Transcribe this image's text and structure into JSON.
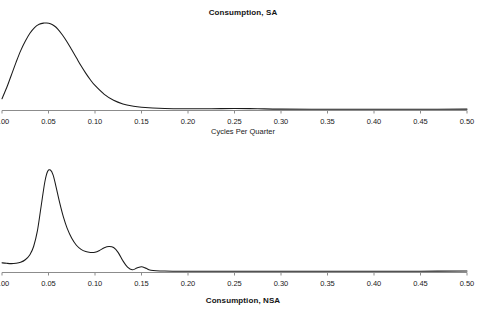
{
  "figure": {
    "background_color": "#ffffff",
    "line_color": "#1a1a1a",
    "axis_color": "#8c8c8c"
  },
  "panels": [
    {
      "id": "sa",
      "title": "Consumption, SA",
      "xlabel": "Cycles Per Quarter"
    },
    {
      "id": "nsa",
      "title": "Consumption, NSA",
      "xlabel": "Cycles Per Quarter"
    }
  ],
  "ticks": {
    "labels": [
      "0.00",
      "0.05",
      "0.10",
      "0.15",
      "0.20",
      "0.25",
      "0.30",
      "0.35",
      "0.40",
      "0.45",
      "0.50"
    ],
    "values": [
      0.0,
      0.05,
      0.1,
      0.15,
      0.2,
      0.25,
      0.3,
      0.35,
      0.4,
      0.45,
      0.5
    ]
  },
  "chart_data": [
    {
      "type": "line",
      "id": "consumption-sa",
      "title": "Consumption, SA",
      "xlabel": "Cycles Per Quarter",
      "ylabel": "",
      "xlim": [
        0.0,
        0.5
      ],
      "ylim": [
        0.0,
        1.0
      ],
      "xticks": [
        0.0,
        0.05,
        0.1,
        0.15,
        0.2,
        0.25,
        0.3,
        0.35,
        0.4,
        0.45,
        0.5
      ],
      "xticklabels": [
        "0.00",
        "0.05",
        "0.10",
        "0.15",
        "0.20",
        "0.25",
        "0.30",
        "0.35",
        "0.40",
        "0.45",
        "0.50"
      ],
      "grid": false,
      "legend": false,
      "notes": "Spectral density, seasonally adjusted. Single broad smooth peak near 0.048 cycles per quarter, long flat near-zero tail beyond 0.15.",
      "series": [
        {
          "name": "spectral density",
          "x": [
            0.0,
            0.005,
            0.01,
            0.015,
            0.02,
            0.025,
            0.03,
            0.035,
            0.04,
            0.045,
            0.048,
            0.052,
            0.056,
            0.06,
            0.065,
            0.07,
            0.075,
            0.08,
            0.085,
            0.09,
            0.095,
            0.1,
            0.11,
            0.12,
            0.13,
            0.14,
            0.15,
            0.175,
            0.2,
            0.225,
            0.25,
            0.275,
            0.3,
            0.35,
            0.4,
            0.45,
            0.5
          ],
          "y": [
            0.13,
            0.255,
            0.4,
            0.545,
            0.68,
            0.79,
            0.882,
            0.948,
            0.985,
            0.999,
            1.0,
            0.992,
            0.968,
            0.93,
            0.862,
            0.782,
            0.692,
            0.6,
            0.508,
            0.424,
            0.348,
            0.282,
            0.18,
            0.112,
            0.07,
            0.046,
            0.032,
            0.018,
            0.014,
            0.014,
            0.018,
            0.014,
            0.01,
            0.008,
            0.008,
            0.008,
            0.01
          ]
        }
      ]
    },
    {
      "type": "line",
      "id": "consumption-nsa",
      "title": "Consumption, NSA",
      "xlabel": "Cycles Per Quarter",
      "ylabel": "",
      "xlim": [
        0.0,
        0.5
      ],
      "ylim": [
        0.0,
        1.0
      ],
      "xticks": [
        0.0,
        0.05,
        0.1,
        0.15,
        0.2,
        0.25,
        0.3,
        0.35,
        0.4,
        0.45,
        0.5
      ],
      "xticklabels": [
        "0.00",
        "0.05",
        "0.10",
        "0.15",
        "0.20",
        "0.25",
        "0.30",
        "0.35",
        "0.40",
        "0.45",
        "0.50"
      ],
      "grid": false,
      "legend": false,
      "notes": "Spectral density, not seasonally adjusted. Sharp dominant spike near 0.052, secondary bump near 0.115, small bump near 0.147, flat tail beyond 0.16.",
      "series": [
        {
          "name": "spectral density",
          "x": [
            0.0,
            0.005,
            0.01,
            0.015,
            0.02,
            0.025,
            0.03,
            0.034,
            0.038,
            0.042,
            0.046,
            0.049,
            0.052,
            0.055,
            0.058,
            0.062,
            0.066,
            0.07,
            0.075,
            0.08,
            0.085,
            0.09,
            0.095,
            0.1,
            0.105,
            0.11,
            0.115,
            0.12,
            0.125,
            0.13,
            0.135,
            0.14,
            0.145,
            0.15,
            0.155,
            0.16,
            0.175,
            0.2,
            0.25,
            0.3,
            0.35,
            0.4,
            0.45,
            0.5
          ],
          "y": [
            0.09,
            0.085,
            0.082,
            0.085,
            0.095,
            0.12,
            0.17,
            0.25,
            0.4,
            0.64,
            0.88,
            0.985,
            1.0,
            0.95,
            0.84,
            0.68,
            0.54,
            0.43,
            0.33,
            0.262,
            0.222,
            0.2,
            0.192,
            0.194,
            0.212,
            0.238,
            0.25,
            0.24,
            0.19,
            0.11,
            0.048,
            0.022,
            0.038,
            0.052,
            0.036,
            0.018,
            0.01,
            0.008,
            0.008,
            0.008,
            0.008,
            0.008,
            0.008,
            0.01
          ]
        }
      ]
    }
  ]
}
